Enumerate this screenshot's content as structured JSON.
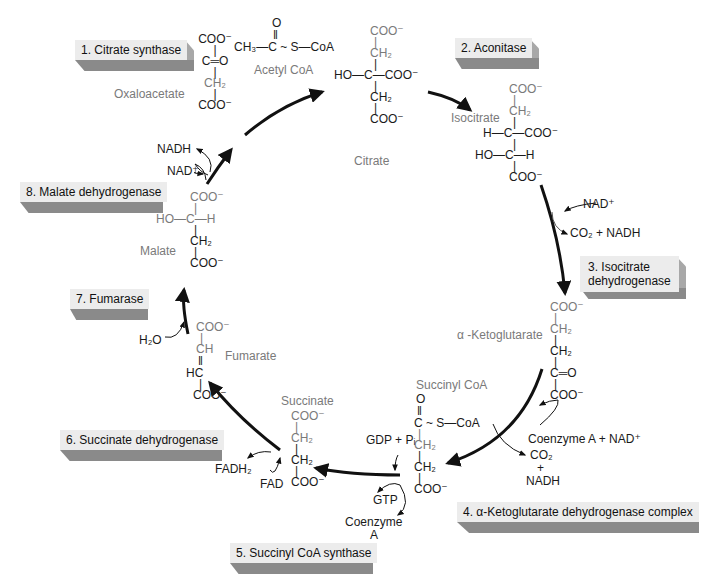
{
  "colors": {
    "arrow": "#111111",
    "molecule_label": "#7a7a7a",
    "atom_text": "#1a1a1a",
    "enzyme_face": "#ececec",
    "enzyme_shadow": "#8a8a8a"
  },
  "enzymes": [
    {
      "step": "1",
      "label": "1. Citrate synthase"
    },
    {
      "step": "2",
      "label": "2. Aconitase"
    },
    {
      "step": "3",
      "label_line1": "3. Isocitrate",
      "label_line2": "dehydrogenase"
    },
    {
      "step": "4",
      "label": "4. α-Ketoglutarate dehydrogenase complex"
    },
    {
      "step": "5",
      "label": "5. Succinyl CoA synthase"
    },
    {
      "step": "6",
      "label": "6. Succinate dehydrogenase"
    },
    {
      "step": "7",
      "label": "7. Fumarase"
    },
    {
      "step": "8",
      "label": "8. Malate dehydrogenase"
    }
  ],
  "molecules": {
    "oxaloacetate": {
      "name": "Oxaloacetate",
      "rows": [
        "COO⁻",
        "|",
        "C═O",
        "|",
        "CH₂",
        "|",
        "COO⁻"
      ]
    },
    "acetyl_coa": {
      "name": "Acetyl CoA",
      "top": "O",
      "bond": "‖",
      "formula": "CH₃—C ~ S—CoA"
    },
    "citrate": {
      "name": "Citrate",
      "rows": [
        "COO⁻",
        "|",
        "CH₂",
        "|",
        "HO—C—COO⁻",
        "|",
        "CH₂",
        "|",
        "COO⁻"
      ]
    },
    "isocitrate": {
      "name": "Isocitrate",
      "rows": [
        "COO⁻",
        "|",
        "CH₂",
        "|",
        "H—C—COO⁻",
        "|",
        "HO—C—H",
        "|",
        "COO⁻"
      ]
    },
    "alpha_ketoglutarate": {
      "name": "α -Ketoglutarate",
      "rows": [
        "COO⁻",
        "|",
        "CH₂",
        "|",
        "CH₂",
        "|",
        "C═O",
        "|",
        "COO⁻"
      ]
    },
    "succinyl_coa": {
      "name": "Succinyl CoA",
      "rows": [
        "O",
        "‖",
        "C ~ S—CoA",
        "|",
        "CH₂",
        "|",
        "CH₂",
        "|",
        "COO⁻"
      ]
    },
    "succinate": {
      "name": "Succinate",
      "rows": [
        "COO⁻",
        "|",
        "CH₂",
        "|",
        "CH₂",
        "|",
        "COO⁻"
      ]
    },
    "fumarate": {
      "name": "Fumarate",
      "rows": [
        "COO⁻",
        "|",
        "CH",
        "‖",
        "HC",
        "|",
        "COO⁻"
      ]
    },
    "malate": {
      "name": "Malate",
      "rows": [
        "COO⁻",
        "|",
        "HO—C—H",
        "|",
        "CH₂",
        "|",
        "COO⁻"
      ]
    }
  },
  "cofactors": {
    "step3_in": "NAD⁺",
    "step3_out": "CO₂ + NADH",
    "step4_in": "Coenzyme A + NAD⁺",
    "step4_out_1": "CO₂",
    "step4_out_plus": "+",
    "step4_out_2": "NADH",
    "step5_in": "GDP + Pᵢ",
    "step5_out_1": "GTP",
    "step5_out_2a": "Coenzyme",
    "step5_out_2b": "A",
    "step6_in": "FAD",
    "step6_out": "FADH₂",
    "step7_in": "H₂O",
    "step8_in": "NAD⁺",
    "step8_out": "NADH"
  }
}
